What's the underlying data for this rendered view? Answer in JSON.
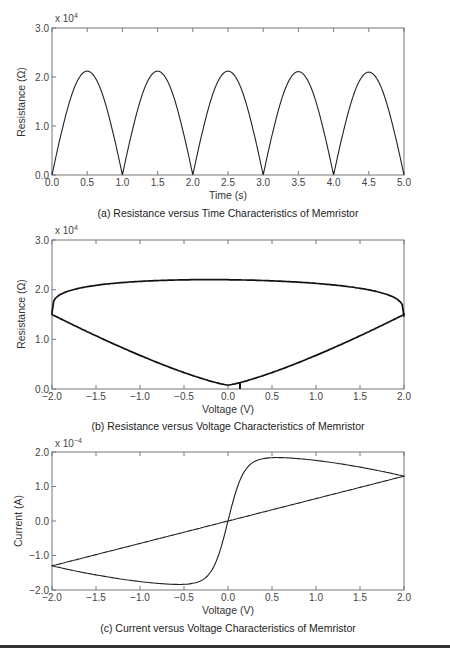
{
  "chart_data": [
    {
      "id": "a",
      "type": "line",
      "title": "(a) Resistance versus Time Characteristics of Memristor",
      "xlabel": "Time (s)",
      "ylabel": "Resistance (Ω)",
      "y_multiplier": "x 10",
      "y_exponent": "4",
      "xlim": [
        0.0,
        5.0
      ],
      "ylim": [
        0.0,
        3.0
      ],
      "xticks": [
        "0.0",
        "0.5",
        "1.0",
        "1.5",
        "2.0",
        "2.5",
        "3.0",
        "3.5",
        "4.0",
        "4.5",
        "5.0"
      ],
      "yticks": [
        "0.0",
        "1.0",
        "2.0",
        "3.0"
      ],
      "grid": false,
      "series": [
        {
          "name": "R(t)",
          "x": [
            0.0,
            0.1,
            0.2,
            0.3,
            0.4,
            0.5,
            0.6,
            0.7,
            0.8,
            0.9,
            1.0,
            1.5,
            2.0,
            2.5,
            3.0,
            3.5,
            4.0,
            4.5,
            5.0
          ],
          "y": [
            0.0,
            0.66,
            1.25,
            1.72,
            2.02,
            2.12,
            2.02,
            1.72,
            1.25,
            0.66,
            0.0,
            2.12,
            0.0,
            2.12,
            0.0,
            2.11,
            0.0,
            2.1,
            0.0
          ]
        }
      ]
    },
    {
      "id": "b",
      "type": "line",
      "title": "(b) Resistance versus Voltage Characteristics of Memristor",
      "xlabel": "Voltage (V)",
      "ylabel": "Resistance (Ω)",
      "y_multiplier": "x 10",
      "y_exponent": "4",
      "xlim": [
        -2.0,
        2.0
      ],
      "ylim": [
        0.0,
        3.0
      ],
      "xticks": [
        "−2.0",
        "−1.5",
        "−1.0",
        "−0.5",
        "0.0",
        "0.5",
        "1.0",
        "1.5",
        "2.0"
      ],
      "yticks": [
        "0.0",
        "1.0",
        "2.0",
        "3.0"
      ],
      "grid": false,
      "series": [
        {
          "name": "upper branch",
          "x": [
            -2.0,
            -1.9,
            -1.5,
            -1.0,
            -0.5,
            0.0,
            0.5,
            1.0,
            1.5,
            1.9,
            2.0
          ],
          "y": [
            1.5,
            1.75,
            1.98,
            2.1,
            2.17,
            2.2,
            2.16,
            2.07,
            1.88,
            1.65,
            1.5
          ]
        },
        {
          "name": "lower branch",
          "x": [
            -2.0,
            -1.5,
            -1.0,
            -0.5,
            0.0,
            0.5,
            1.0,
            1.5,
            2.0
          ],
          "y": [
            1.5,
            0.92,
            0.58,
            0.28,
            0.08,
            0.28,
            0.58,
            0.95,
            1.5
          ]
        }
      ]
    },
    {
      "id": "c",
      "type": "line",
      "title": "(c) Current versus Voltage Characteristics of Memristor",
      "xlabel": "Voltage (V)",
      "ylabel": "Current (A)",
      "y_multiplier": "x 10",
      "y_exponent": "−4",
      "xlim": [
        -2.0,
        2.0
      ],
      "ylim": [
        -2.0,
        2.0
      ],
      "xticks": [
        "−2.0",
        "−1.5",
        "−1.0",
        "−0.5",
        "0.0",
        "0.5",
        "1.0",
        "1.5",
        "2.0"
      ],
      "yticks": [
        "−2.0",
        "−1.0",
        "0.0",
        "1.0",
        "2.0"
      ],
      "grid": false,
      "series": [
        {
          "name": "pinched hysteresis loop",
          "x": [
            -2.0,
            -1.5,
            -1.0,
            -0.5,
            -0.3,
            -0.15,
            0.0,
            0.15,
            0.3,
            0.5,
            1.0,
            1.5,
            2.0,
            1.5,
            1.0,
            0.5,
            0.0,
            -0.5,
            -1.0,
            -1.5,
            -2.0
          ],
          "y": [
            -1.3,
            -1.72,
            -1.82,
            -1.85,
            -1.6,
            -0.9,
            0.0,
            0.9,
            1.6,
            1.85,
            1.8,
            1.65,
            1.3,
            0.95,
            0.62,
            0.3,
            0.0,
            -0.3,
            -0.62,
            -0.95,
            -1.3
          ]
        }
      ]
    }
  ]
}
